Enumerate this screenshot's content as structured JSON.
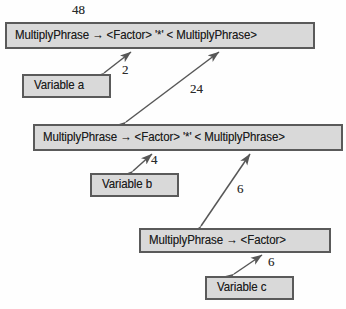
{
  "diagram": {
    "background_color": "#fefefe",
    "node_fill_color": "#d9d9d9",
    "node_border_color": "#5a5a5a",
    "edge_color": "#575757",
    "nodes": [
      {
        "id": "prod-top",
        "label": "MultiplyPhrase → <Factor>  '*' < MultiplyPhrase>"
      },
      {
        "id": "var-a",
        "label": "Variable a"
      },
      {
        "id": "prod-mid",
        "label": "MultiplyPhrase → <Factor>  '*' < MultiplyPhrase>"
      },
      {
        "id": "var-b",
        "label": "Variable b"
      },
      {
        "id": "prod-bottom",
        "label": "MultiplyPhrase → <Factor>"
      },
      {
        "id": "var-c",
        "label": "Variable c"
      }
    ],
    "edges": [
      {
        "id": "e-48",
        "weight": "48",
        "from": "prod-top",
        "to": "prod-top"
      },
      {
        "id": "e-2",
        "weight": "2",
        "from": "prod-top",
        "to": "var-a"
      },
      {
        "id": "e-24",
        "weight": "24",
        "from": "prod-top",
        "to": "prod-mid"
      },
      {
        "id": "e-4",
        "weight": "4",
        "from": "prod-mid",
        "to": "var-b"
      },
      {
        "id": "e-6a",
        "weight": "6",
        "from": "prod-mid",
        "to": "prod-bottom"
      },
      {
        "id": "e-6b",
        "weight": "6",
        "from": "prod-bottom",
        "to": "var-c"
      }
    ]
  }
}
